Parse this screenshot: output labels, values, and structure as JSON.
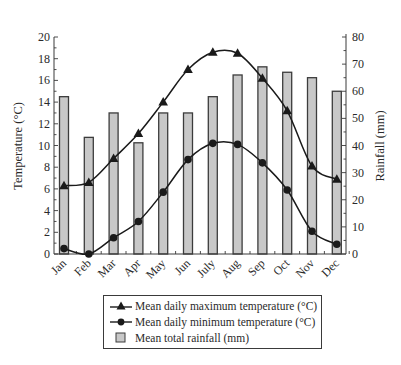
{
  "chart_data": {
    "type": "bar+line",
    "title": "",
    "categories": [
      "Jan",
      "Feb",
      "Mar",
      "Apr",
      "May",
      "Jun",
      "July",
      "Aug",
      "Sep",
      "Oct",
      "Nov",
      "Dec"
    ],
    "series": [
      {
        "name": "Mean daily maximum temperature (°C)",
        "type": "line",
        "marker": "triangle",
        "axis": "left",
        "values": [
          6.3,
          6.6,
          8.8,
          11.1,
          14.0,
          17.0,
          18.6,
          18.5,
          16.2,
          13.2,
          8.1,
          6.9
        ]
      },
      {
        "name": "Mean daily minimum temperature (°C)",
        "type": "line",
        "marker": "circle",
        "axis": "left",
        "values": [
          0.5,
          0.0,
          1.5,
          3.0,
          5.7,
          8.7,
          10.2,
          10.1,
          8.4,
          5.9,
          2.1,
          0.9
        ]
      },
      {
        "name": "Mean total rainfall (mm)",
        "type": "bar",
        "axis": "right",
        "values": [
          58,
          43,
          52,
          41,
          52,
          52,
          58,
          66,
          69,
          67,
          65,
          60
        ]
      }
    ],
    "ylabel_left": "Temperature (°C)",
    "ylabel_right": "Rainfall (mm)",
    "ylim_left": [
      0,
      20
    ],
    "ylim_right": [
      0,
      80
    ],
    "yticks_left": [
      0,
      2,
      4,
      6,
      8,
      10,
      12,
      14,
      16,
      18,
      20
    ],
    "yticks_right": [
      0,
      10,
      20,
      30,
      40,
      50,
      60,
      70,
      80
    ],
    "xlabel": "",
    "grid": false,
    "legend_position": "bottom"
  },
  "legend": {
    "items": [
      {
        "label": "Mean daily maximum temperature (°C)",
        "icon": "triangle-line-icon"
      },
      {
        "label": "Mean daily minimum temperature (°C)",
        "icon": "circle-line-icon"
      },
      {
        "label": "Mean total rainfall (mm)",
        "icon": "grey-square-icon"
      }
    ]
  },
  "colors": {
    "bar_fill": "#c8c8c8",
    "bar_edge": "#3c3c3c",
    "line": "#1a1a1a",
    "axis": "#3a3a3a",
    "text": "#2a2a2a"
  }
}
